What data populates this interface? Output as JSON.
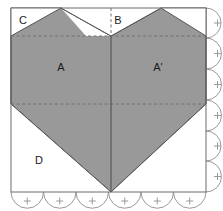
{
  "figure": {
    "canvas": {
      "width": 223,
      "height": 211
    },
    "colors": {
      "fill_gray": "#999999",
      "outline": "#555555",
      "frame": "#6b6b6b",
      "dashed": "#707070",
      "scallop": "#9a9a9a",
      "label_text": "#1a1a1a",
      "background": "#ffffff"
    },
    "frame": {
      "left": 11,
      "top": 8,
      "right": 206,
      "bottom": 192
    },
    "heart": {
      "cleft_x": 111,
      "left_peak_x": 61,
      "right_peak_x": 161,
      "shoulder_y": 36,
      "waist_y": 104,
      "tip_y": 192,
      "top_y": 8
    },
    "guides": {
      "dashed_horizontal_y": [
        36,
        104
      ],
      "center_vertical_x": 111,
      "dotted_top_segment": {
        "x": 111,
        "from_y": 8,
        "to_y": 36
      }
    },
    "scallops": {
      "right_edge_count": 6,
      "bottom_edge_count": 6,
      "radius": 15,
      "tick_marks": true
    }
  },
  "labels": [
    {
      "id": "label-c",
      "text": "C",
      "x": 23,
      "y": 24,
      "region": "top-left background corner"
    },
    {
      "id": "label-b",
      "text": "B",
      "x": 118,
      "y": 24,
      "region": "top-center background notch"
    },
    {
      "id": "label-a",
      "text": "A",
      "x": 61,
      "y": 71,
      "region": "left heart half"
    },
    {
      "id": "label-ap",
      "text": "A'",
      "x": 158,
      "y": 71,
      "region": "right heart half"
    },
    {
      "id": "label-d",
      "text": "D",
      "x": 39,
      "y": 164,
      "region": "bottom-left background"
    }
  ]
}
